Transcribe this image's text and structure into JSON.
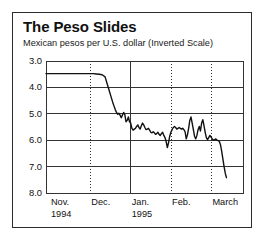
{
  "chart_data": {
    "type": "line",
    "title": "The Peso Slides",
    "subtitle": "Mexican pesos per U.S. dollar (Inverted Scale)",
    "xlabel": "",
    "ylabel": "",
    "inverted_y": true,
    "grid": true,
    "legend": null,
    "ylim": [
      3.0,
      8.0
    ],
    "yticks": [
      "3.0",
      "4.0",
      "5.0",
      "6.0",
      "7.0",
      "8.0"
    ],
    "ytick_values": [
      3.0,
      4.0,
      5.0,
      6.0,
      7.0,
      8.0
    ],
    "xticks": [
      {
        "label": "Nov.",
        "sublabel": "1994",
        "pos": 0.02,
        "divider": "none"
      },
      {
        "label": "Dec.",
        "sublabel": "",
        "pos": 0.225,
        "divider": "dotted"
      },
      {
        "label": "Jan.",
        "sublabel": "1995",
        "pos": 0.43,
        "divider": "solid"
      },
      {
        "label": "Feb.",
        "sublabel": "",
        "pos": 0.635,
        "divider": "dotted"
      },
      {
        "label": "March",
        "sublabel": "",
        "pos": 0.84,
        "divider": "dotted"
      }
    ],
    "xlim": [
      0,
      1
    ],
    "series": [
      {
        "name": "Mexican peso per U.S. dollar",
        "color": "#111111",
        "x": [
          0.0,
          0.02,
          0.04,
          0.06,
          0.08,
          0.1,
          0.12,
          0.14,
          0.16,
          0.18,
          0.2,
          0.22,
          0.24,
          0.255,
          0.27,
          0.285,
          0.3,
          0.31,
          0.32,
          0.33,
          0.338,
          0.345,
          0.352,
          0.358,
          0.364,
          0.37,
          0.376,
          0.382,
          0.388,
          0.394,
          0.4,
          0.406,
          0.412,
          0.418,
          0.424,
          0.43,
          0.436,
          0.442,
          0.448,
          0.454,
          0.46,
          0.466,
          0.472,
          0.478,
          0.484,
          0.49,
          0.496,
          0.502,
          0.508,
          0.514,
          0.52,
          0.526,
          0.532,
          0.538,
          0.544,
          0.55,
          0.556,
          0.562,
          0.568,
          0.574,
          0.58,
          0.586,
          0.592,
          0.598,
          0.604,
          0.61,
          0.616,
          0.622,
          0.628,
          0.634,
          0.64,
          0.646,
          0.652,
          0.658,
          0.664,
          0.67,
          0.676,
          0.682,
          0.688,
          0.694,
          0.7,
          0.706,
          0.712,
          0.718,
          0.724,
          0.73,
          0.736,
          0.742,
          0.748,
          0.754,
          0.76,
          0.766,
          0.772,
          0.778,
          0.784,
          0.79,
          0.796,
          0.802,
          0.808,
          0.814,
          0.82,
          0.826,
          0.832,
          0.838,
          0.844,
          0.85,
          0.856,
          0.862,
          0.868,
          0.874,
          0.88,
          0.886,
          0.892,
          0.898,
          0.904,
          0.91,
          0.916
        ],
        "y": [
          3.48,
          3.48,
          3.48,
          3.48,
          3.48,
          3.48,
          3.48,
          3.48,
          3.48,
          3.48,
          3.48,
          3.48,
          3.48,
          3.49,
          3.5,
          3.52,
          3.6,
          3.85,
          4.1,
          4.35,
          4.55,
          4.7,
          4.85,
          4.95,
          5.02,
          4.98,
          5.05,
          5.15,
          5.05,
          4.95,
          5.02,
          5.3,
          5.25,
          5.12,
          5.3,
          5.35,
          5.55,
          5.62,
          5.58,
          5.55,
          5.48,
          5.42,
          5.52,
          5.58,
          5.45,
          5.35,
          5.42,
          5.52,
          5.6,
          5.58,
          5.55,
          5.62,
          5.7,
          5.72,
          5.68,
          5.72,
          5.78,
          5.75,
          5.7,
          5.78,
          5.82,
          5.75,
          5.7,
          5.82,
          5.9,
          6.05,
          6.28,
          6.1,
          5.85,
          5.7,
          5.6,
          5.52,
          5.48,
          5.52,
          5.58,
          5.55,
          5.52,
          5.55,
          5.58,
          5.55,
          5.6,
          5.68,
          5.95,
          5.8,
          5.55,
          5.25,
          5.12,
          5.35,
          5.6,
          5.85,
          5.95,
          5.82,
          5.6,
          5.48,
          5.65,
          5.35,
          5.22,
          5.45,
          5.7,
          5.9,
          5.98,
          5.9,
          5.82,
          5.88,
          5.95,
          6.0,
          5.98,
          5.95,
          6.0,
          6.02,
          6.05,
          6.18,
          6.42,
          6.72,
          7.0,
          7.25,
          7.42
        ]
      }
    ],
    "annotations": []
  }
}
